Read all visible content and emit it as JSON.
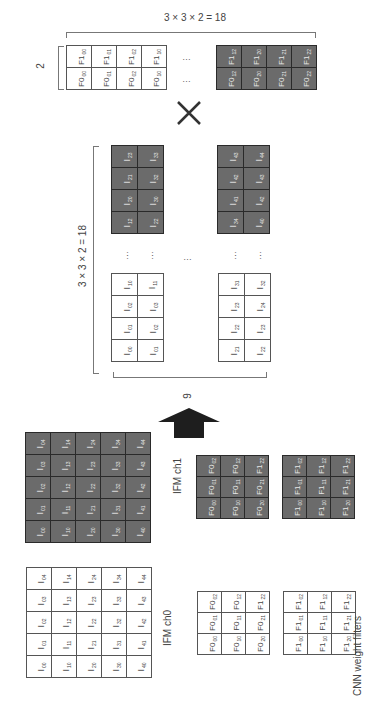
{
  "weight_matrix": {
    "width_label": "3 × 3 × 2 = 18",
    "height_label": "2",
    "white_cols": [
      {
        "top": {
          "f": "F1",
          "s": "00"
        },
        "bottom": {
          "f": "F0",
          "s": "00"
        }
      },
      {
        "top": {
          "f": "F1",
          "s": "01"
        },
        "bottom": {
          "f": "F0",
          "s": "01"
        }
      },
      {
        "top": {
          "f": "F1",
          "s": "02"
        },
        "bottom": {
          "f": "F0",
          "s": "02"
        }
      },
      {
        "top": {
          "f": "F1",
          "s": "10"
        },
        "bottom": {
          "f": "F0",
          "s": "10"
        }
      }
    ],
    "dark_cols": [
      {
        "top": {
          "f": "F1",
          "s": "12"
        },
        "bottom": {
          "f": "F0",
          "s": "12"
        }
      },
      {
        "top": {
          "f": "F1",
          "s": "20"
        },
        "bottom": {
          "f": "F0",
          "s": "20"
        }
      },
      {
        "top": {
          "f": "F1",
          "s": "21"
        },
        "bottom": {
          "f": "F0",
          "s": "21"
        }
      },
      {
        "top": {
          "f": "F1",
          "s": "22"
        },
        "bottom": {
          "f": "F0",
          "s": "22"
        }
      }
    ],
    "ellipsis": "…"
  },
  "multiply_symbol": "×",
  "im2col_matrix": {
    "height_label": "3 × 3 × 2 = 18",
    "width_label": "9",
    "ellipsis": "…",
    "left_dark": [
      [
        "23",
        "33"
      ],
      [
        "21",
        "32"
      ],
      [
        "20",
        "30"
      ],
      [
        "12",
        "22"
      ]
    ],
    "right_dark": [
      [
        "43",
        "44"
      ],
      [
        "42",
        "43"
      ],
      [
        "41",
        "42"
      ],
      [
        "34",
        "40"
      ]
    ],
    "left_white": [
      [
        "10",
        "11"
      ],
      [
        "02",
        "03"
      ],
      [
        "01",
        "02"
      ],
      [
        "00",
        "01"
      ]
    ],
    "right_white": [
      [
        "31",
        "32"
      ],
      [
        "23",
        "24"
      ],
      [
        "22",
        "23"
      ],
      [
        "21",
        "22"
      ]
    ]
  },
  "ifm": {
    "ch0_label": "IFM ch0",
    "ch1_label": "IFM ch1",
    "grid": [
      [
        "04",
        "14",
        "24",
        "34",
        "44"
      ],
      [
        "03",
        "13",
        "23",
        "33",
        "43"
      ],
      [
        "02",
        "12",
        "22",
        "32",
        "42"
      ],
      [
        "01",
        "11",
        "21",
        "31",
        "41"
      ],
      [
        "00",
        "10",
        "20",
        "30",
        "40"
      ]
    ]
  },
  "filters": {
    "caption": "CNN weight filters",
    "f0_grid": [
      [
        {
          "f": "F0",
          "s": "02"
        },
        {
          "f": "F0",
          "s": "12"
        },
        {
          "f": "F1",
          "s": "22"
        }
      ],
      [
        {
          "f": "F0",
          "s": "01"
        },
        {
          "f": "F0",
          "s": "11"
        },
        {
          "f": "F0",
          "s": "21"
        }
      ],
      [
        {
          "f": "F0",
          "s": "00"
        },
        {
          "f": "F0",
          "s": "10"
        },
        {
          "f": "F0",
          "s": "20"
        }
      ]
    ],
    "f1_grid": [
      [
        {
          "f": "F1",
          "s": "02"
        },
        {
          "f": "F1",
          "s": "12"
        },
        {
          "f": "F1",
          "s": "22"
        }
      ],
      [
        {
          "f": "F1",
          "s": "01"
        },
        {
          "f": "F1",
          "s": "11"
        },
        {
          "f": "F1",
          "s": "21"
        }
      ],
      [
        {
          "f": "F1",
          "s": "00"
        },
        {
          "f": "F1",
          "s": "10"
        },
        {
          "f": "F1",
          "s": "20"
        }
      ]
    ]
  },
  "colors": {
    "dark_fill": "#6b6b6b",
    "border": "#555555",
    "arrow": "#1e1e1e"
  }
}
